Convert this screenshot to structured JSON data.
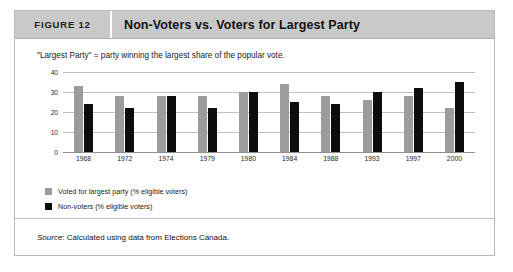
{
  "header": {
    "figure_number": "FIGURE 12",
    "title": "Non-Voters vs. Voters for Largest Party"
  },
  "note": "\"Largest Party\" = party winning the largest share of the popular vote.",
  "legend": {
    "items": [
      {
        "label": "Voted for largest party (% eligible voters)",
        "color": "#9c9c9c",
        "swatch": "gray"
      },
      {
        "label": "Non-voters (% eligible voters)",
        "color": "#0d0d0d",
        "swatch": "black"
      }
    ]
  },
  "footer": {
    "source_label": "Source",
    "source_text": ": Calculated using data from Elections Canada."
  },
  "colors": {
    "header_bg": "#c9c9c9",
    "series_voted": "#9c9c9c",
    "series_nonvoters": "#0d0d0d",
    "border": "#b9b9b9"
  },
  "chart_data": {
    "type": "bar",
    "title": "Non-Voters vs. Voters for Largest Party",
    "xlabel": "",
    "ylabel": "",
    "ylim": [
      0,
      40
    ],
    "yticks": [
      40,
      30,
      20,
      10,
      0
    ],
    "grid": true,
    "legend_position": "bottom-left",
    "categories": [
      "1968",
      "1972",
      "1974",
      "1979",
      "1980",
      "1984",
      "1988",
      "1993",
      "1997",
      "2000"
    ],
    "series": [
      {
        "name": "Voted for largest party (% eligible voters)",
        "color": "#9c9c9c",
        "values": [
          33,
          28,
          28,
          28,
          30,
          34,
          28,
          26,
          28,
          22
        ]
      },
      {
        "name": "Non-voters (% eligible voters)",
        "color": "#0d0d0d",
        "values": [
          24,
          22,
          28,
          22,
          30,
          25,
          24,
          30,
          32,
          35
        ]
      }
    ]
  }
}
